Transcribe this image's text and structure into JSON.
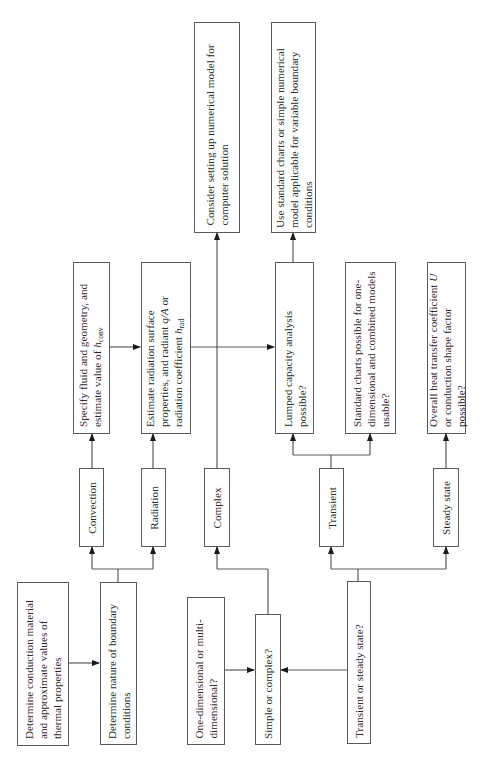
{
  "diagram": {
    "type": "flowchart",
    "orientation": "rotated-90-ccw",
    "line_color": "#5a5a5a",
    "nodes": {
      "conduction_material": {
        "label": "Determine conduction material and approximate values of thermal properties"
      },
      "boundary_conditions": {
        "label": "Determine nature of boundary conditions"
      },
      "dimensionality": {
        "label": "One-dimensional or multi-dimensional?"
      },
      "simple_or_complex": {
        "label": "Simple or complex?"
      },
      "transient_or_steady": {
        "label": "Transient or steady state?"
      },
      "convection": {
        "label": "Convection"
      },
      "radiation": {
        "label": "Radiation"
      },
      "complex": {
        "label": "Complex"
      },
      "transient": {
        "label": "Transient"
      },
      "steady_state": {
        "label": "Steady state"
      },
      "specify_fluid": {
        "label_pre": "Specify fluid and geometry, and estimate value of ",
        "symbol": "h",
        "subscript": "conv"
      },
      "estimate_radiation": {
        "label_pre": "Estimate radiation surface properties, and radiant ",
        "symbol_q": "q/A",
        "label_mid": " or radiation coefficient ",
        "symbol": "h",
        "subscript": "rad"
      },
      "lumped_capacity": {
        "label": "Lumped capacity analysis possible?"
      },
      "standard_charts": {
        "label": "Standard charts possible for one-dimensional and combined models usable?"
      },
      "overall_coefficient": {
        "label_pre": "Overall heat transfer coefficient ",
        "symbol": "U",
        "label_post": " or conduction shape factor possible?"
      },
      "numerical_model": {
        "label": "Consider setting up numerical model for computer solution"
      },
      "standard_or_numerical": {
        "label": "Use standard charts or simple numerical model applicable for variable boundary conditions"
      }
    },
    "edges": [
      [
        "conduction_material",
        "boundary_conditions"
      ],
      [
        "boundary_conditions",
        "convection"
      ],
      [
        "boundary_conditions",
        "radiation"
      ],
      [
        "convection",
        "specify_fluid"
      ],
      [
        "radiation",
        "estimate_radiation"
      ],
      [
        "specify_fluid",
        "estimate_radiation"
      ],
      [
        "estimate_radiation",
        "lumped_capacity"
      ],
      [
        "dimensionality",
        "simple_or_complex"
      ],
      [
        "transient_or_steady",
        "simple_or_complex"
      ],
      [
        "simple_or_complex",
        "complex"
      ],
      [
        "complex",
        "numerical_model"
      ],
      [
        "transient_or_steady",
        "transient"
      ],
      [
        "transient_or_steady",
        "steady_state"
      ],
      [
        "transient",
        "lumped_capacity"
      ],
      [
        "transient",
        "standard_charts"
      ],
      [
        "steady_state",
        "overall_coefficient"
      ],
      [
        "lumped_capacity",
        "standard_or_numerical"
      ]
    ]
  }
}
